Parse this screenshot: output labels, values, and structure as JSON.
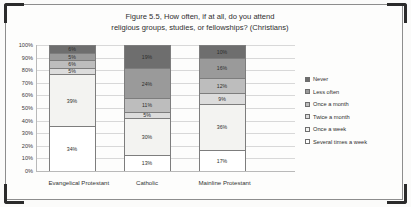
{
  "figure": {
    "title_line1": "Figure 5.5, How often, if at all, do you attend",
    "title_line2": "religious groups, studies, or fellowships? (Christians)"
  },
  "chart_data": {
    "type": "bar",
    "stacked": true,
    "stack_mode": "percent",
    "title": "Figure 5.5, How often, if at all, do you attend religious groups, studies, or fellowships? (Christians)",
    "xlabel": "",
    "ylabel": "",
    "ylim": [
      0,
      100
    ],
    "yticks": [
      "0%",
      "10%",
      "20%",
      "30%",
      "40%",
      "50%",
      "60%",
      "70%",
      "80%",
      "90%",
      "100%"
    ],
    "grid": true,
    "legend_position": "right",
    "categories": [
      "Evangelical Protestant",
      "Catholic",
      "Mainline Protestant"
    ],
    "series": [
      {
        "name": "Never",
        "color": "#6e6e6e",
        "values": [
          6,
          19,
          10
        ],
        "labels": [
          "6%",
          "19%",
          "10%"
        ]
      },
      {
        "name": "Less often",
        "color": "#9a9a9a",
        "values": [
          5,
          24,
          16
        ],
        "labels": [
          "5%",
          "24%",
          "16%"
        ]
      },
      {
        "name": "Once a month",
        "color": "#bdbdbd",
        "values": [
          6,
          11,
          12
        ],
        "labels": [
          "6%",
          "11%",
          "12%"
        ]
      },
      {
        "name": "Twice a month",
        "color": "#dcdcdc",
        "values": [
          5,
          5,
          9
        ],
        "labels": [
          "5%",
          "5%",
          "9%"
        ]
      },
      {
        "name": "Once a week",
        "color": "#f3f3f1",
        "values": [
          39,
          30,
          36
        ],
        "labels": [
          "39%",
          "30%",
          "36%"
        ]
      },
      {
        "name": "Several times a week",
        "color": "#ffffff",
        "values": [
          34,
          13,
          17
        ],
        "labels": [
          "34%",
          "13%",
          "17%"
        ]
      }
    ]
  },
  "legend": {
    "items": [
      {
        "label": "Never"
      },
      {
        "label": "Less often"
      },
      {
        "label": "Once a month"
      },
      {
        "label": "Twice a month"
      },
      {
        "label": "Once a week"
      },
      {
        "label": "Several times a week"
      }
    ]
  }
}
